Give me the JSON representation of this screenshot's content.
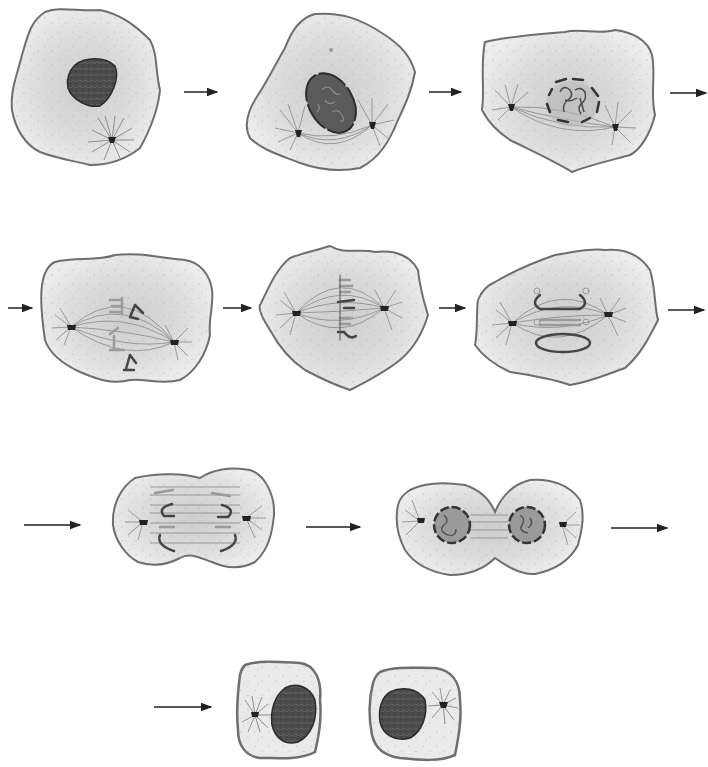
{
  "diagram": {
    "type": "cell-division-sequence",
    "text_labels": [],
    "colors": {
      "background": "#ffffff",
      "cell_membrane": "#6e6e6e",
      "cytoplasm": "#e6e6e6",
      "cytoplasm_center": "#cfcfcf",
      "nucleus": "#4a4a4a",
      "nuclear_envelope_dashed": "#333333",
      "spindle_fiber": "#7a7a7a",
      "centrosome": "#222222",
      "chromosome": "#555555",
      "arrow": "#222222"
    },
    "stages": [
      {
        "index": 1,
        "depicts": "cell with intact dark nucleus and single centrosome with aster"
      },
      {
        "index": 2,
        "depicts": "cell with oval nucleus, condensing chromosomes, two separating centrosomes with spindle"
      },
      {
        "index": 3,
        "depicts": "cell with fragmenting (dashed) nuclear envelope, condensed chromosomes, spindle between poles"
      },
      {
        "index": 4,
        "depicts": "chromosomes attaching to spindle fibers between two poles"
      },
      {
        "index": 5,
        "depicts": "chromosomes aligned along the cell's equatorial plate"
      },
      {
        "index": 6,
        "depicts": "sister chromatids separating toward poles"
      },
      {
        "index": 7,
        "depicts": "elongated cell pinching with chromatids at opposite poles"
      },
      {
        "index": 8,
        "depicts": "two forming nuclei with dashed envelopes, cleavage furrow dividing cell"
      },
      {
        "index": 9,
        "depicts": "two separate daughter cells each with dark nucleus and centrosome"
      }
    ],
    "arrows": [
      {
        "from": 1,
        "to": 2
      },
      {
        "from": 2,
        "to": 3
      },
      {
        "from": 3,
        "to": 4,
        "wraps_row": true
      },
      {
        "from": 4,
        "to": 5
      },
      {
        "from": 5,
        "to": 6
      },
      {
        "from": 6,
        "to": 7,
        "wraps_row": true
      },
      {
        "from": 7,
        "to": 8
      },
      {
        "from": 8,
        "to": 9,
        "wraps_row": true
      }
    ]
  }
}
